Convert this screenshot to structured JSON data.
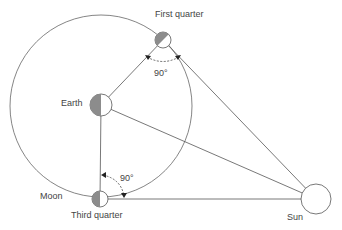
{
  "diagram": {
    "labels": {
      "first_quarter": "First quarter",
      "third_quarter": "Third quarter",
      "earth": "Earth",
      "moon": "Moon",
      "sun": "Sun",
      "angle_top": "90°",
      "angle_bottom": "90°"
    },
    "colors": {
      "line": "#555555",
      "shade": "#8c8c8c",
      "background": "#ffffff"
    },
    "bodies": [
      {
        "name": "Earth",
        "cx": 101,
        "cy": 105,
        "r": 11
      },
      {
        "name": "First quarter moon",
        "cx": 163,
        "cy": 40,
        "r": 8
      },
      {
        "name": "Third quarter moon",
        "cx": 100,
        "cy": 199,
        "r": 8
      },
      {
        "name": "Sun",
        "cx": 316,
        "cy": 199,
        "r": 15
      }
    ],
    "orbit": {
      "cx": 101,
      "cy": 106,
      "r": 91
    }
  }
}
